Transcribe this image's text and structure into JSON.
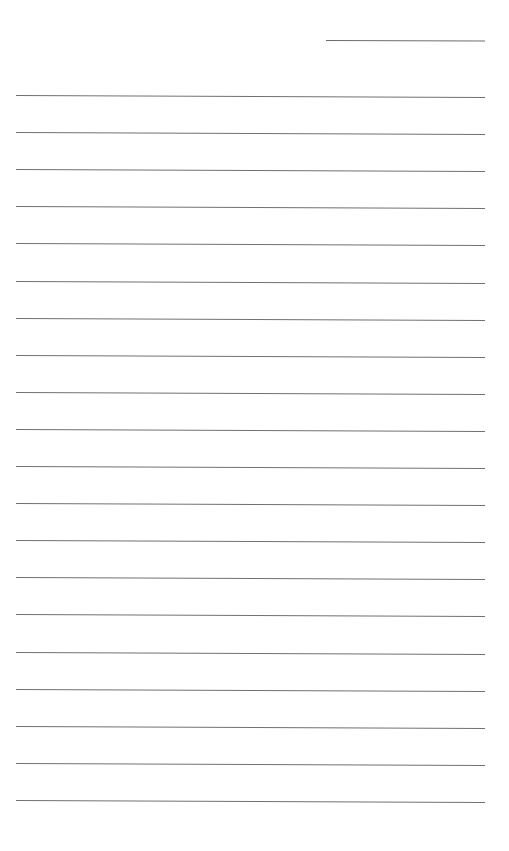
{
  "page": {
    "type": "lined-paper",
    "background_color": "#ffffff",
    "line_color": "#707070"
  },
  "header": {
    "name_line": {
      "present": true,
      "text": ""
    }
  },
  "body": {
    "line_count": 20,
    "first_line_y": 95,
    "line_spacing": 37.1,
    "lines": [
      "",
      "",
      "",
      "",
      "",
      "",
      "",
      "",
      "",
      "",
      "",
      "",
      "",
      "",
      "",
      "",
      "",
      "",
      "",
      ""
    ]
  }
}
